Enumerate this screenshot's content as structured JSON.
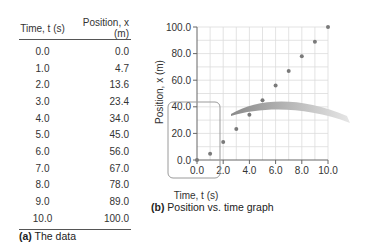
{
  "table": {
    "headers": [
      "Time, t (s)",
      "Position, x (m)"
    ],
    "rows": [
      [
        "0.0",
        "0.0"
      ],
      [
        "1.0",
        "4.7"
      ],
      [
        "2.0",
        "13.6"
      ],
      [
        "3.0",
        "23.4"
      ],
      [
        "4.0",
        "34.0"
      ],
      [
        "5.0",
        "45.0"
      ],
      [
        "6.0",
        "56.0"
      ],
      [
        "7.0",
        "67.0"
      ],
      [
        "8.0",
        "78.0"
      ],
      [
        "9.0",
        "89.0"
      ],
      [
        "10.0",
        "100.0"
      ]
    ],
    "caption_label": "(a)",
    "caption_text": " The data"
  },
  "graph": {
    "caption_label": "(b)",
    "caption_text": " Position vs. time graph"
  },
  "colors": {
    "point": "#7a7a7a",
    "grid": "#dcdcdc",
    "axis": "#666666",
    "highlight_box": "#9a9a9a"
  },
  "chart_data": {
    "type": "scatter",
    "title": "Position vs. time graph",
    "xlabel": "Time, t (s)",
    "ylabel": "Position, x (m)",
    "x": [
      0.0,
      1.0,
      2.0,
      3.0,
      4.0,
      5.0,
      6.0,
      7.0,
      8.0,
      9.0,
      10.0
    ],
    "y": [
      0.0,
      4.7,
      13.6,
      23.4,
      34.0,
      45.0,
      56.0,
      67.0,
      78.0,
      89.0,
      100.0
    ],
    "xlim": [
      0,
      10
    ],
    "ylim": [
      0,
      100
    ],
    "xticks": [
      "0.0",
      "2.0",
      "4.0",
      "6.0",
      "8.0",
      "10.0"
    ],
    "yticks": [
      "0.0",
      "20.0",
      "40.0",
      "60.0",
      "80.0",
      "100.0"
    ],
    "grid": true,
    "legend": null,
    "annotations": [
      "rounded highlight box around region t 0–4.6 s, x 0–40 m",
      "curved arrow pointing right from box"
    ]
  }
}
